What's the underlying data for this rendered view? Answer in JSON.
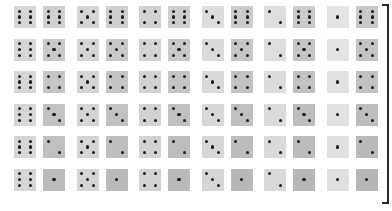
{
  "figure": {
    "type": "dice-outcome-grid",
    "rows": 6,
    "cols": 6,
    "pair_order": "first-die-left,second-die-right",
    "row_values": [
      6,
      5,
      4,
      3,
      2,
      1
    ],
    "col_values": [
      6,
      5,
      4,
      3,
      2,
      1
    ],
    "background_color": "#ffffff",
    "pip_color": "#1a1a1a",
    "spine_color": "#2b2b2b"
  },
  "chart_data": {
    "type": "table",
    "title": "",
    "xlabel": "",
    "ylabel": "",
    "categories": [
      "6",
      "5",
      "4",
      "3",
      "2",
      "1"
    ],
    "cells": [
      [
        {
          "left": 6,
          "right": 6,
          "left_shade": "#d6d6d6",
          "right_shade": "#d0d0d0"
        },
        {
          "left": 5,
          "right": 6,
          "left_shade": "#d4d4d4",
          "right_shade": "#cfcfcf"
        },
        {
          "left": 4,
          "right": 6,
          "left_shade": "#d2d2d2",
          "right_shade": "#cdcdcd"
        },
        {
          "left": 3,
          "right": 6,
          "left_shade": "#dcdcdc",
          "right_shade": "#cbcbcb"
        },
        {
          "left": 2,
          "right": 6,
          "left_shade": "#dedede",
          "right_shade": "#cacaca"
        },
        {
          "left": 1,
          "right": 6,
          "left_shade": "#e4e4e4",
          "right_shade": "#c9c9c9"
        }
      ],
      [
        {
          "left": 6,
          "right": 5,
          "left_shade": "#d6d6d6",
          "right_shade": "#c9c9c9"
        },
        {
          "left": 5,
          "right": 5,
          "left_shade": "#d4d4d4",
          "right_shade": "#c8c8c8"
        },
        {
          "left": 4,
          "right": 5,
          "left_shade": "#d3d3d3",
          "right_shade": "#c7c7c7"
        },
        {
          "left": 3,
          "right": 5,
          "left_shade": "#dadada",
          "right_shade": "#c6c6c6"
        },
        {
          "left": 2,
          "right": 5,
          "left_shade": "#dddddd",
          "right_shade": "#c5c5c5"
        },
        {
          "left": 1,
          "right": 5,
          "left_shade": "#e3e3e3",
          "right_shade": "#c4c4c4"
        }
      ],
      [
        {
          "left": 6,
          "right": 4,
          "left_shade": "#d6d6d6",
          "right_shade": "#c6c6c6"
        },
        {
          "left": 5,
          "right": 4,
          "left_shade": "#d4d4d4",
          "right_shade": "#c5c5c5"
        },
        {
          "left": 4,
          "right": 4,
          "left_shade": "#d2d2d2",
          "right_shade": "#c4c4c4"
        },
        {
          "left": 3,
          "right": 4,
          "left_shade": "#d9d9d9",
          "right_shade": "#c3c3c3"
        },
        {
          "left": 2,
          "right": 4,
          "left_shade": "#dcdcdc",
          "right_shade": "#c2c2c2"
        },
        {
          "left": 1,
          "right": 4,
          "left_shade": "#e2e2e2",
          "right_shade": "#c1c1c1"
        }
      ],
      [
        {
          "left": 6,
          "right": 3,
          "left_shade": "#d6d6d6",
          "right_shade": "#c2c2c2"
        },
        {
          "left": 5,
          "right": 3,
          "left_shade": "#d4d4d4",
          "right_shade": "#c1c1c1"
        },
        {
          "left": 4,
          "right": 3,
          "left_shade": "#d2d2d2",
          "right_shade": "#c0c0c0"
        },
        {
          "left": 3,
          "right": 3,
          "left_shade": "#d8d8d8",
          "right_shade": "#bfbfbf"
        },
        {
          "left": 2,
          "right": 3,
          "left_shade": "#dbdbdb",
          "right_shade": "#bebebe"
        },
        {
          "left": 1,
          "right": 3,
          "left_shade": "#e1e1e1",
          "right_shade": "#bdbdbd"
        }
      ],
      [
        {
          "left": 6,
          "right": 2,
          "left_shade": "#d6d6d6",
          "right_shade": "#bfbfbf"
        },
        {
          "left": 5,
          "right": 2,
          "left_shade": "#d4d4d4",
          "right_shade": "#bebebe"
        },
        {
          "left": 4,
          "right": 2,
          "left_shade": "#d2d2d2",
          "right_shade": "#bdbdbd"
        },
        {
          "left": 3,
          "right": 2,
          "left_shade": "#d7d7d7",
          "right_shade": "#bcbcbc"
        },
        {
          "left": 2,
          "right": 2,
          "left_shade": "#dadada",
          "right_shade": "#bbbbbb"
        },
        {
          "left": 1,
          "right": 2,
          "left_shade": "#e0e0e0",
          "right_shade": "#bababa"
        }
      ],
      [
        {
          "left": 6,
          "right": 1,
          "left_shade": "#d6d6d6",
          "right_shade": "#bbbbbb"
        },
        {
          "left": 5,
          "right": 1,
          "left_shade": "#d4d4d4",
          "right_shade": "#bababa"
        },
        {
          "left": 4,
          "right": 1,
          "left_shade": "#d2d2d2",
          "right_shade": "#b9b9b9"
        },
        {
          "left": 3,
          "right": 1,
          "left_shade": "#d6d6d6",
          "right_shade": "#b8b8b8"
        },
        {
          "left": 2,
          "right": 1,
          "left_shade": "#d9d9d9",
          "right_shade": "#b7b7b7"
        },
        {
          "left": 1,
          "right": 1,
          "left_shade": "#dfdfdf",
          "right_shade": "#b6b6b6"
        }
      ]
    ]
  },
  "layout": {
    "origin_x": 14,
    "origin_y": 6,
    "cell_pitch_x": 62.5,
    "cell_pitch_y": 32.5,
    "die_size": 22,
    "die_gap": 7,
    "pip_size": 3.2
  }
}
